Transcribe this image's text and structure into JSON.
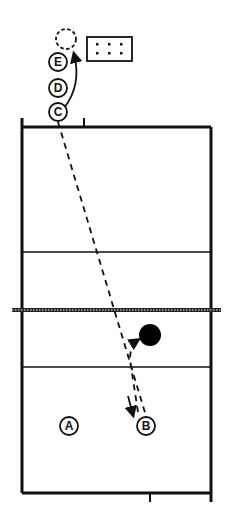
{
  "diagram": {
    "type": "volleyball-court-drill",
    "colors": {
      "ink": "#111111",
      "background": "#ffffff",
      "ball": "#000000"
    },
    "players": [
      {
        "label": "A",
        "role": "player"
      },
      {
        "label": "B",
        "role": "player"
      },
      {
        "label": "C",
        "role": "player-in-line"
      },
      {
        "label": "D",
        "role": "player-in-line"
      },
      {
        "label": "E",
        "role": "player-in-line"
      }
    ],
    "elements": {
      "ball": "ball",
      "ball_cart": "ball-cart",
      "next_position": "dashed-player-position"
    },
    "paths": [
      {
        "from": "C",
        "to": "B",
        "style": "dashed",
        "meaning": "ball path"
      },
      {
        "from": "B",
        "to": "ball",
        "style": "dashed",
        "meaning": "player movement"
      },
      {
        "from": "C",
        "to": "next-position",
        "style": "solid",
        "meaning": "rotate to end of line"
      }
    ]
  }
}
